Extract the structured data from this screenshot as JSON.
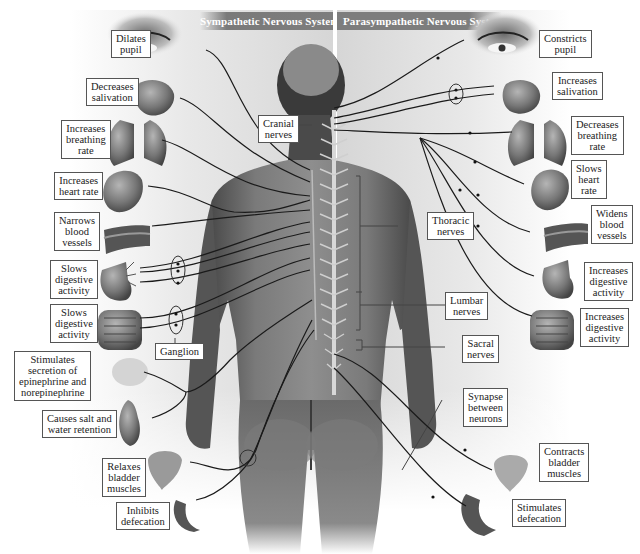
{
  "headers": {
    "sympathetic": "Sympathetic Nervous System",
    "parasympathetic": "Parasympathetic Nervous System"
  },
  "colors": {
    "header_bg": "#7a7a7a",
    "header_text": "#ffffff",
    "nerve_line": "#1a1a1a",
    "label_border": "#555555",
    "body_tone": "#6e6e6e",
    "panel_bg": "#d9d9d9"
  },
  "sympathetic_labels": [
    {
      "id": "dilates-pupil",
      "text": "Dilates\npupil",
      "organ": "eye"
    },
    {
      "id": "decreases-salivation",
      "text": "Decreases\nsalivation",
      "organ": "salivary-glands"
    },
    {
      "id": "increases-breathing-rate",
      "text": "Increases\nbreathing\nrate",
      "organ": "lungs"
    },
    {
      "id": "increases-heart-rate",
      "text": "Increases\nheart rate",
      "organ": "heart"
    },
    {
      "id": "narrows-blood-vessels",
      "text": "Narrows\nblood\nvessels",
      "organ": "blood-vessel"
    },
    {
      "id": "slows-digestive-activity-stomach",
      "text": "Slows\ndigestive\nactivity",
      "organ": "stomach"
    },
    {
      "id": "slows-digestive-activity-intestine",
      "text": "Slows\ndigestive\nactivity",
      "organ": "intestines"
    },
    {
      "id": "stimulates-secretion",
      "text": "Stimulates\nsecretion of\nepinephrine and\nnorepinephrine",
      "organ": "adrenal-gland"
    },
    {
      "id": "causes-salt-water-retention",
      "text": "Causes salt and\nwater retention",
      "organ": "kidney"
    },
    {
      "id": "relaxes-bladder-muscles",
      "text": "Relaxes\nbladder\nmuscles",
      "organ": "bladder"
    },
    {
      "id": "inhibits-defecation",
      "text": "Inhibits\ndefecation",
      "organ": "rectum"
    }
  ],
  "parasympathetic_labels": [
    {
      "id": "constricts-pupil",
      "text": "Constricts\npupil",
      "organ": "eye"
    },
    {
      "id": "increases-salivation",
      "text": "Increases\nsalivation",
      "organ": "salivary-glands"
    },
    {
      "id": "decreases-breathing-rate",
      "text": "Decreases\nbreathing\nrate",
      "organ": "lungs"
    },
    {
      "id": "slows-heart-rate",
      "text": "Slows\nheart\nrate",
      "organ": "heart"
    },
    {
      "id": "widens-blood-vessels",
      "text": "Widens\nblood\nvessels",
      "organ": "blood-vessel"
    },
    {
      "id": "increases-digestive-activity-stomach",
      "text": "Increases\ndigestive\nactivity",
      "organ": "stomach"
    },
    {
      "id": "increases-digestive-activity-intestine",
      "text": "Increases\ndigestive\nactivity",
      "organ": "intestines"
    },
    {
      "id": "contracts-bladder-muscles",
      "text": "Contracts\nbladder\nmuscles",
      "organ": "bladder"
    },
    {
      "id": "stimulates-defecation",
      "text": "Stimulates\ndefecation",
      "organ": "rectum"
    }
  ],
  "center_labels": {
    "cranial": "Cranial\nnerves",
    "thoracic": "Thoracic\nnerves",
    "lumbar": "Lumbar\nnerves",
    "sacral": "Sacral\nnerves",
    "ganglion": "Ganglion",
    "synapse": "Synapse\nbetween\nneurons"
  }
}
